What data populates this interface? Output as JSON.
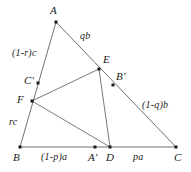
{
  "figure": {
    "background_color": "#ffffff",
    "line_color": "#6b6b6b",
    "point_color": "#1a1a1a",
    "text_color": "#1a1a1a",
    "width": 191,
    "height": 172
  },
  "points": {
    "A": {
      "name": "A",
      "label": "A",
      "x": 56,
      "y": 22,
      "label_x": 50,
      "label_y": 5
    },
    "B": {
      "name": "B",
      "label": "B",
      "x": 20,
      "y": 147,
      "label_x": 13,
      "label_y": 152
    },
    "C": {
      "name": "C",
      "label": "C",
      "x": 176,
      "y": 147,
      "label_x": 174,
      "label_y": 152
    },
    "D": {
      "name": "D",
      "label": "D",
      "x": 110,
      "y": 147,
      "label_x": 106,
      "label_y": 152
    },
    "E": {
      "name": "E",
      "label": "E",
      "x": 99,
      "y": 69,
      "label_x": 103,
      "label_y": 54
    },
    "F": {
      "name": "F",
      "label": "F",
      "x": 32,
      "y": 101,
      "label_x": 17,
      "label_y": 94
    },
    "Aprime": {
      "name": "A'",
      "label": "A'",
      "x": 95,
      "y": 147,
      "label_x": 88,
      "label_y": 152
    },
    "Bprime": {
      "name": "B'",
      "label": "B'",
      "x": 113,
      "y": 85,
      "label_x": 116,
      "label_y": 71
    },
    "Cprime": {
      "name": "C'",
      "label": "C'",
      "x": 38,
      "y": 83,
      "label_x": 24,
      "label_y": 75
    }
  },
  "side_labels": {
    "AE": {
      "text": "qb",
      "x": 80,
      "y": 31
    },
    "EC": {
      "text": "(1-q)b",
      "x": 142,
      "y": 100
    },
    "AC2": {
      "text": "(1-r)c",
      "x": 12,
      "y": 48
    },
    "FB": {
      "text": "rc",
      "x": 9,
      "y": 117
    },
    "BD": {
      "text": "(1-p)a",
      "x": 41,
      "y": 152
    },
    "DC": {
      "text": "pa",
      "x": 133,
      "y": 152
    }
  },
  "segments": [
    {
      "name": "side-AB",
      "from": "A",
      "to": "B",
      "kind": "outer"
    },
    {
      "name": "side-BC",
      "from": "B",
      "to": "C",
      "kind": "outer"
    },
    {
      "name": "side-AC",
      "from": "A",
      "to": "C",
      "kind": "outer"
    },
    {
      "name": "cevian-F-E",
      "from": "F",
      "to": "E",
      "kind": "inner"
    },
    {
      "name": "cevian-F-D",
      "from": "F",
      "to": "D",
      "kind": "inner"
    },
    {
      "name": "cevian-E-D",
      "from": "E",
      "to": "D",
      "kind": "inner"
    }
  ]
}
